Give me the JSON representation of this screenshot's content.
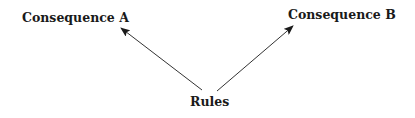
{
  "diagram": {
    "nodes": [
      {
        "id": "consequence_a",
        "label": "Consequence A"
      },
      {
        "id": "consequence_b",
        "label": "Consequence B"
      },
      {
        "id": "rules",
        "label": "Rules"
      }
    ],
    "edges": [
      {
        "from": "rules",
        "to": "consequence_a"
      },
      {
        "from": "rules",
        "to": "consequence_b"
      }
    ],
    "colors": {
      "line": "#333333",
      "text": "#1a1a1a",
      "background": "#ffffff"
    }
  }
}
